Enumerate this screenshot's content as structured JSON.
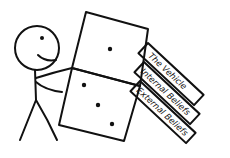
{
  "figure": {
    "labels": [
      {
        "text": "The Vehicle"
      },
      {
        "text": "Internal Beliefs"
      },
      {
        "text": "External Beliefs"
      }
    ],
    "dice": [
      {
        "name": "top-die",
        "pips": 1
      },
      {
        "name": "bottom-die",
        "pips": 3
      }
    ],
    "colors": {
      "ink": "#111111",
      "background": "#ffffff"
    }
  }
}
